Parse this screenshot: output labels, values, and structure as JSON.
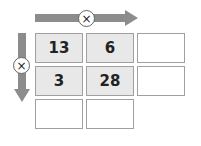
{
  "diagram": {
    "operation_symbol": "×",
    "top_arrow": {
      "direction": "right",
      "operator": "×",
      "color": "#8c8c8c"
    },
    "left_arrow": {
      "direction": "down",
      "operator": "×",
      "color": "#8c8c8c"
    },
    "grid": {
      "rows": [
        [
          "13",
          "6",
          ""
        ],
        [
          "3",
          "28",
          ""
        ],
        [
          "",
          ""
        ]
      ],
      "shaded_color": "#e8e8e8",
      "border_color": "#a0a0a0"
    }
  }
}
